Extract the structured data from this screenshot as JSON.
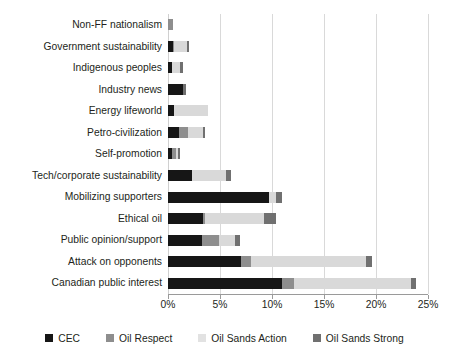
{
  "chart_data": {
    "type": "bar",
    "orientation": "horizontal",
    "stacked": true,
    "title": "",
    "xlabel": "",
    "ylabel": "",
    "xlim": [
      0,
      25
    ],
    "xunit": "%",
    "grid": true,
    "legend_position": "bottom",
    "xticks": [
      0,
      5,
      10,
      15,
      20,
      25
    ],
    "xticklabels": [
      "0%",
      "5%",
      "10%",
      "15%",
      "20%",
      "25%"
    ],
    "categories": [
      "Non-FF nationalism",
      "Government sustainability",
      "Indigenous peoples",
      "Industry news",
      "Energy lifeworld",
      "Petro-civilization",
      "Self-promotion",
      "Tech/corporate sustainability",
      "Mobilizing supporters",
      "Ethical oil",
      "Public opinion/support",
      "Attack on opponents",
      "Canadian public interest"
    ],
    "series": [
      {
        "name": "CEC",
        "color": "#161616",
        "values": [
          0.0,
          0.5,
          0.4,
          1.4,
          0.6,
          1.1,
          0.4,
          2.3,
          9.7,
          3.4,
          3.3,
          7.0,
          11.0
        ]
      },
      {
        "name": "Oil Respect",
        "color": "#8e8e8e",
        "values": [
          0.5,
          0.1,
          0.0,
          0.0,
          0.0,
          0.8,
          0.4,
          0.0,
          0.0,
          0.2,
          1.6,
          1.0,
          1.1
        ]
      },
      {
        "name": "Oil Sands Action",
        "color": "#d9d9d9",
        "values": [
          0.0,
          1.2,
          0.8,
          0.0,
          3.2,
          1.5,
          0.2,
          3.3,
          0.7,
          5.6,
          1.5,
          11.0,
          11.3
        ]
      },
      {
        "name": "Oil Sands Strong",
        "color": "#707070",
        "values": [
          0.0,
          0.2,
          0.2,
          0.3,
          0.0,
          0.2,
          0.2,
          0.5,
          0.6,
          1.2,
          0.5,
          0.6,
          0.4
        ]
      }
    ],
    "totals": [
      0.5,
      2.0,
      1.4,
      1.7,
      3.8,
      3.6,
      1.2,
      6.1,
      11.0,
      10.4,
      6.9,
      19.6,
      23.8
    ]
  }
}
